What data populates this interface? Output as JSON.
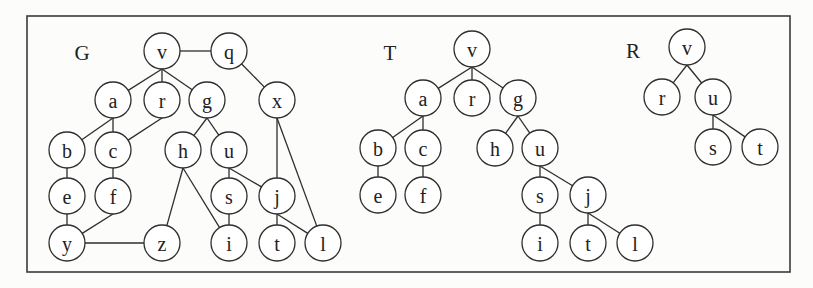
{
  "figure": {
    "frame": {
      "x": 27,
      "y": 16,
      "width": 763,
      "height": 256,
      "stroke": "#3a3a3a"
    },
    "node_radius": 18,
    "node_fill": "#ffffff",
    "stroke_color": "#2e2e2e",
    "text_color": "#222222"
  },
  "graphs": [
    {
      "name": "G",
      "label": {
        "text": "G",
        "x": 82,
        "y": 53
      },
      "nodes": [
        {
          "id": "v",
          "x": 162,
          "y": 51
        },
        {
          "id": "q",
          "x": 229,
          "y": 51
        },
        {
          "id": "a",
          "x": 113,
          "y": 100
        },
        {
          "id": "r",
          "x": 162,
          "y": 100
        },
        {
          "id": "g",
          "x": 207,
          "y": 100
        },
        {
          "id": "x",
          "x": 277,
          "y": 100
        },
        {
          "id": "b",
          "x": 67,
          "y": 150
        },
        {
          "id": "c",
          "x": 113,
          "y": 150
        },
        {
          "id": "h",
          "x": 183,
          "y": 150
        },
        {
          "id": "u",
          "x": 229,
          "y": 150
        },
        {
          "id": "e",
          "x": 67,
          "y": 196
        },
        {
          "id": "f",
          "x": 113,
          "y": 196
        },
        {
          "id": "s",
          "x": 229,
          "y": 196
        },
        {
          "id": "j",
          "x": 277,
          "y": 196
        },
        {
          "id": "y",
          "x": 67,
          "y": 243
        },
        {
          "id": "z",
          "x": 162,
          "y": 243
        },
        {
          "id": "i",
          "x": 229,
          "y": 243
        },
        {
          "id": "t",
          "x": 277,
          "y": 243
        },
        {
          "id": "l",
          "x": 323,
          "y": 243
        }
      ],
      "edges": [
        [
          "v",
          "q",
          "center"
        ],
        [
          "q",
          "x",
          "boundary"
        ],
        [
          "v",
          "a",
          "bottom"
        ],
        [
          "v",
          "r",
          "bottom"
        ],
        [
          "v",
          "g",
          "bottom"
        ],
        [
          "a",
          "b",
          "bottom"
        ],
        [
          "a",
          "c",
          "bottom"
        ],
        [
          "r",
          "c",
          "bottom"
        ],
        [
          "g",
          "h",
          "bottom"
        ],
        [
          "g",
          "u",
          "bottom"
        ],
        [
          "b",
          "e",
          "bottom"
        ],
        [
          "c",
          "f",
          "bottom"
        ],
        [
          "e",
          "y",
          "bottom"
        ],
        [
          "f",
          "y",
          "bottom"
        ],
        [
          "y",
          "z",
          "center"
        ],
        [
          "h",
          "z",
          "bottom"
        ],
        [
          "h",
          "i",
          "bottom"
        ],
        [
          "u",
          "s",
          "bottom"
        ],
        [
          "u",
          "j",
          "bottom"
        ],
        [
          "s",
          "i",
          "bottom"
        ],
        [
          "x",
          "j",
          "bottom"
        ],
        [
          "x",
          "l",
          "bottom"
        ],
        [
          "j",
          "t",
          "bottom"
        ],
        [
          "j",
          "l",
          "bottom"
        ]
      ]
    },
    {
      "name": "T",
      "label": {
        "text": "T",
        "x": 390,
        "y": 53
      },
      "nodes": [
        {
          "id": "v",
          "x": 472,
          "y": 49
        },
        {
          "id": "a",
          "x": 423,
          "y": 98
        },
        {
          "id": "r",
          "x": 472,
          "y": 98
        },
        {
          "id": "g",
          "x": 518,
          "y": 98
        },
        {
          "id": "b",
          "x": 378,
          "y": 148
        },
        {
          "id": "c",
          "x": 423,
          "y": 148
        },
        {
          "id": "h",
          "x": 495,
          "y": 148
        },
        {
          "id": "u",
          "x": 540,
          "y": 148
        },
        {
          "id": "e",
          "x": 378,
          "y": 195
        },
        {
          "id": "f",
          "x": 423,
          "y": 195
        },
        {
          "id": "s",
          "x": 540,
          "y": 195
        },
        {
          "id": "j",
          "x": 588,
          "y": 195
        },
        {
          "id": "i",
          "x": 540,
          "y": 243
        },
        {
          "id": "t",
          "x": 588,
          "y": 243
        },
        {
          "id": "l",
          "x": 635,
          "y": 243
        }
      ],
      "edges": [
        [
          "v",
          "a",
          "bottom"
        ],
        [
          "v",
          "r",
          "bottom"
        ],
        [
          "v",
          "g",
          "bottom"
        ],
        [
          "a",
          "b",
          "bottom"
        ],
        [
          "a",
          "c",
          "bottom"
        ],
        [
          "g",
          "h",
          "bottom"
        ],
        [
          "g",
          "u",
          "bottom"
        ],
        [
          "b",
          "e",
          "bottom"
        ],
        [
          "c",
          "f",
          "bottom"
        ],
        [
          "u",
          "s",
          "bottom"
        ],
        [
          "u",
          "j",
          "bottom"
        ],
        [
          "s",
          "i",
          "bottom"
        ],
        [
          "j",
          "t",
          "bottom"
        ],
        [
          "j",
          "l",
          "bottom"
        ]
      ]
    },
    {
      "name": "R",
      "label": {
        "text": "R",
        "x": 633,
        "y": 51
      },
      "nodes": [
        {
          "id": "v",
          "x": 687,
          "y": 47
        },
        {
          "id": "r",
          "x": 662,
          "y": 97
        },
        {
          "id": "u",
          "x": 713,
          "y": 97
        },
        {
          "id": "s",
          "x": 713,
          "y": 147
        },
        {
          "id": "t",
          "x": 760,
          "y": 147
        }
      ],
      "edges": [
        [
          "v",
          "r",
          "bottom"
        ],
        [
          "v",
          "u",
          "bottom"
        ],
        [
          "u",
          "s",
          "bottom"
        ],
        [
          "u",
          "t",
          "bottom"
        ]
      ]
    }
  ]
}
